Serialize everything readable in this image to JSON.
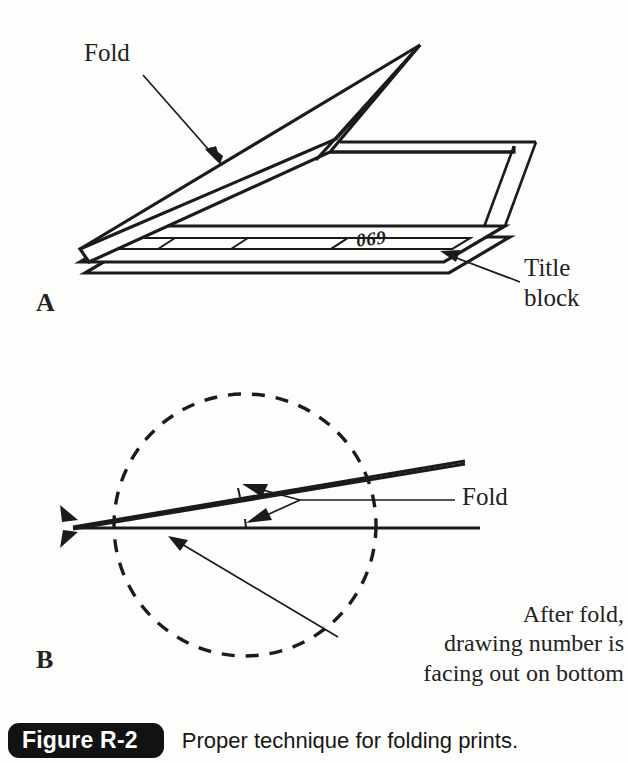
{
  "figure": {
    "badge_label": "Figure R-2",
    "caption": "Proper technique for folding prints."
  },
  "panel_a": {
    "label": "A",
    "fold_label": "Fold",
    "title_block_label": "Title\nblock",
    "drawing_number": "069",
    "description": "Isometric view of a print sheet with one corner folded up, showing the title block strip along the bottom edge and the drawing number at its right end."
  },
  "panel_b": {
    "label": "B",
    "fold_label": "Fold",
    "note": "After fold,\ndrawing number is\nfacing out on bottom",
    "description": "Edge-on view of the folded print inside a dashed circle, with double arrows marking the fold and a leader pointing to the bottom sheet."
  },
  "colors": {
    "ink": "#1b1b1b",
    "paper": "#fdfdfb",
    "badge_background": "#121212",
    "badge_text": "#ffffff"
  }
}
